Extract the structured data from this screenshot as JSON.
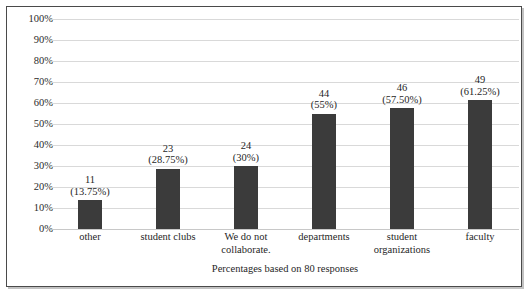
{
  "chart_data": {
    "type": "bar",
    "title": "",
    "xlabel": "",
    "ylabel": "",
    "ylim": [
      0,
      100
    ],
    "grid": true,
    "legend": "none",
    "bar_color": "#3b3b3b",
    "gridline_color": "#d9d9d9",
    "frame_color": "#4a4a4a",
    "categories": [
      "other",
      "student clubs",
      "We do not collaborate.",
      "departments",
      "student organizations",
      "faculty"
    ],
    "counts": [
      11,
      23,
      24,
      44,
      46,
      49
    ],
    "values": [
      13.75,
      28.75,
      30,
      55,
      57.5,
      61.25
    ],
    "y_ticks": [
      "0%",
      "10%",
      "20%",
      "30%",
      "40%",
      "50%",
      "60%",
      "70%",
      "80%",
      "90%",
      "100%"
    ],
    "y_tick_values": [
      0,
      10,
      20,
      30,
      40,
      50,
      60,
      70,
      80,
      90,
      100
    ],
    "bars": [
      {
        "category": "other",
        "category_lines": [
          "other"
        ],
        "count": 11,
        "percent": 13.75,
        "label_count": "11",
        "label_pct": "(13.75%)"
      },
      {
        "category": "student clubs",
        "category_lines": [
          "student clubs"
        ],
        "count": 23,
        "percent": 28.75,
        "label_count": "23",
        "label_pct": "(28.75%)"
      },
      {
        "category": "We do not collaborate.",
        "category_lines": [
          "We do not",
          "collaborate."
        ],
        "count": 24,
        "percent": 30,
        "label_count": "24",
        "label_pct": "(30%)"
      },
      {
        "category": "departments",
        "category_lines": [
          "departments"
        ],
        "count": 44,
        "percent": 55,
        "label_count": "44",
        "label_pct": "(55%)"
      },
      {
        "category": "student organizations",
        "category_lines": [
          "student",
          "organizations"
        ],
        "count": 46,
        "percent": 57.5,
        "label_count": "46",
        "label_pct": "(57.50%)"
      },
      {
        "category": "faculty",
        "category_lines": [
          "faculty"
        ],
        "count": 49,
        "percent": 61.25,
        "label_count": "49",
        "label_pct": "(61.25%)"
      }
    ],
    "caption": "Percentages based on 80 responses",
    "total_responses": 80
  }
}
